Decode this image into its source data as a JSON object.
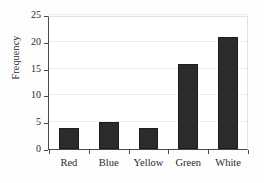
{
  "chart_data": {
    "type": "bar",
    "title": "",
    "xlabel": "",
    "ylabel": "Frequency",
    "categories": [
      "Red",
      "Blue",
      "Yellow",
      "Green",
      "White"
    ],
    "values": [
      4,
      5,
      4,
      16,
      21
    ],
    "ylim": [
      0,
      25
    ],
    "yticks": [
      0,
      5,
      10,
      15,
      20,
      25
    ],
    "ytick_labels": [
      "0",
      "5",
      "10",
      "15",
      "20",
      "25"
    ],
    "grid": true,
    "legend": false,
    "bar_color": "#2b2b2b",
    "background_color": "#ffffff",
    "grid_color": "#ededed",
    "axis_color": "#4a4a4a"
  }
}
